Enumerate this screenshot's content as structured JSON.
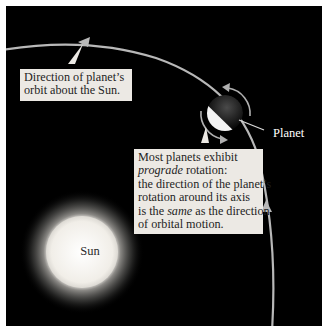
{
  "figure": {
    "labels": {
      "orbit_direction": {
        "line1": "Direction of planet’s",
        "line2": "orbit about the Sun."
      },
      "planet": "Planet",
      "sun": "Sun",
      "prograde_note": {
        "line1": "Most planets exhibit",
        "line2_italic": "prograde",
        "line2_rest": " rotation:",
        "line3": "the direction of the planet’s",
        "line4": "rotation around its axis",
        "line5_pre": "is the ",
        "line5_italic": "same",
        "line5_post": " as the direction",
        "line6": "of orbital motion."
      }
    },
    "colors": {
      "background": "#000000",
      "frame": "#ffffff",
      "orbit": "#b8b8b8",
      "label_box": "#ece9e4",
      "sun_core": "#f4f1ec",
      "planet_lit": "#f2f2f2",
      "planet_dark": "#1a1a1a"
    }
  }
}
